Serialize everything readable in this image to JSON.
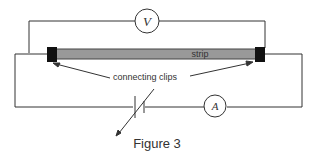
{
  "diagram": {
    "strip_label": "strip",
    "clips_label": "connecting clips",
    "voltmeter_label": "V",
    "ammeter_label": "A",
    "caption": "Figure 3"
  },
  "colors": {
    "wire": "#333333",
    "strip": "#999999",
    "clip": "#111111",
    "background": "#ffffff"
  }
}
